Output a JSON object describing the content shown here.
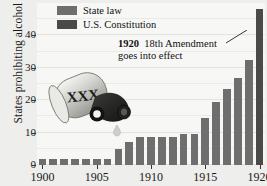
{
  "chart_data": {
    "type": "bar",
    "title": "",
    "xlabel": "",
    "ylabel": "States prohibiting alcohol",
    "ylim": [
      0,
      50
    ],
    "yticks": [
      0,
      10,
      20,
      30,
      40
    ],
    "xticks": [
      1900,
      1905,
      1910,
      1915,
      1920
    ],
    "grid": true,
    "legend_position": "top-left",
    "categories": [
      1900,
      1901,
      1902,
      1903,
      1904,
      1905,
      1906,
      1907,
      1908,
      1909,
      1910,
      1911,
      1912,
      1913,
      1914,
      1915,
      1916,
      1917,
      1918,
      1919,
      1920
    ],
    "values": [
      2,
      2,
      2,
      2,
      2,
      2,
      2,
      5,
      7,
      8.5,
      8.5,
      8.5,
      8.5,
      9.5,
      9.5,
      14.5,
      19.5,
      23.5,
      27,
      32.5,
      33.5
    ],
    "series": [
      {
        "name": "State law",
        "color": "#6e6e6e",
        "values": [
          2,
          2,
          2,
          2,
          2,
          2,
          2,
          5,
          7,
          8.5,
          8.5,
          8.5,
          8.5,
          9.5,
          9.5,
          14.5,
          19.5,
          23.5,
          27,
          32.5,
          33.5
        ]
      },
      {
        "name": "U.S. Constitution",
        "color": "#4a4a4a",
        "values": [
          null,
          null,
          null,
          null,
          null,
          null,
          null,
          null,
          null,
          null,
          null,
          null,
          null,
          null,
          null,
          null,
          null,
          null,
          null,
          null,
          48
        ]
      }
    ],
    "annotations": [
      {
        "line1_bold": "1920",
        "line1_rest": "18th Amendment",
        "line2": "goes into effect",
        "points_to": 1920
      }
    ]
  },
  "legend": {
    "items": [
      {
        "label": "State law",
        "color": "#6e6e6e"
      },
      {
        "label": "U.S. Constitution",
        "color": "#4a4a4a"
      }
    ]
  },
  "axis": {
    "y_title": "States prohibiting alcohol",
    "y_tick_labels": [
      "0",
      "10",
      "20",
      "30",
      "40"
    ],
    "x_tick_labels": [
      "1900",
      "1905",
      "1910",
      "1915",
      "1920"
    ]
  },
  "annotation": {
    "year": "1920",
    "headline": "18th Amendment",
    "subline": "goes into effect"
  },
  "illustration": {
    "name": "moonshine-jug",
    "marking": "XXX"
  },
  "colors": {
    "background": "#eeeeec",
    "plot_background": "#f7f7f5",
    "bar_state_law": "#6e6e6e",
    "bar_constitution": "#4a4a4a",
    "gridline": "#e2e2de",
    "text": "#111111"
  }
}
